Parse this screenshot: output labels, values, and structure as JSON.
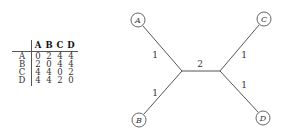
{
  "matrix": {
    "headers": [
      "A",
      "B",
      "C",
      "D"
    ],
    "rows": [
      {
        "label": "A",
        "values": [
          "0",
          "2",
          "4",
          "4"
        ]
      },
      {
        "label": "B",
        "values": [
          "2",
          "0",
          "4",
          "4"
        ]
      },
      {
        "label": "C",
        "values": [
          "4",
          "4",
          "0",
          "2"
        ]
      },
      {
        "label": "D",
        "values": [
          "4",
          "4",
          "2",
          "0"
        ]
      }
    ]
  },
  "tree": {
    "leaves": [
      {
        "name": "A",
        "x": 138,
        "y": 20
      },
      {
        "name": "B",
        "x": 139,
        "y": 120
      },
      {
        "name": "C",
        "x": 264,
        "y": 19
      },
      {
        "name": "D",
        "x": 263,
        "y": 118
      }
    ],
    "internal_nodes": [
      {
        "id": "u",
        "x": 182,
        "y": 71
      },
      {
        "id": "v",
        "x": 220,
        "y": 71
      }
    ],
    "edge_labels": {
      "A_u": "1",
      "B_u": "1",
      "u_v": "2",
      "C_v": "1",
      "D_v": "1"
    },
    "colors": {
      "stroke": "#555555",
      "text": "#333333"
    }
  }
}
